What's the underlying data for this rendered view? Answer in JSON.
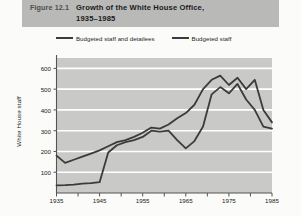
{
  "figure": {
    "number_label": "Figure 12.1",
    "title_lines": [
      "Growth of the White House Office,",
      "1935–1985"
    ],
    "banner_color": "#b9b9b7"
  },
  "legend": {
    "position": "top",
    "items": [
      {
        "label": "Budgeted staff and detailees",
        "color": "#3b3b3b"
      },
      {
        "label": "Budgeted staff",
        "color": "#3b3b3b"
      }
    ]
  },
  "chart_data": {
    "type": "line",
    "title": "Growth of the White House Office, 1935–1985",
    "xlabel": "",
    "ylabel": "White House staff",
    "xlim": [
      1935,
      1985
    ],
    "ylim": [
      0,
      650
    ],
    "grid": true,
    "grid_orientation": "horizontal",
    "plot_background": "#c9c9c7",
    "gridline_color": "#ffffff",
    "x_ticks_major": [
      1935,
      1945,
      1955,
      1965,
      1975,
      1985
    ],
    "x_ticks_minor": [
      1940,
      1950,
      1960,
      1970,
      1980
    ],
    "y_ticks": [
      100,
      200,
      300,
      400,
      500,
      600
    ],
    "series": [
      {
        "name": "Budgeted staff and detailees",
        "color": "#3b3b3b",
        "x": [
          1935,
          1937,
          1939,
          1941,
          1943,
          1945,
          1947,
          1949,
          1951,
          1953,
          1955,
          1957,
          1959,
          1961,
          1963,
          1965,
          1967,
          1969,
          1971,
          1973,
          1975,
          1977,
          1979,
          1981,
          1983,
          1985
        ],
        "y": [
          180,
          145,
          160,
          175,
          190,
          205,
          225,
          245,
          255,
          270,
          290,
          315,
          310,
          330,
          360,
          385,
          425,
          500,
          545,
          565,
          520,
          555,
          500,
          545,
          400,
          340
        ]
      },
      {
        "name": "Budgeted staff",
        "color": "#3b3b3b",
        "x": [
          1935,
          1937,
          1939,
          1941,
          1943,
          1945,
          1947,
          1949,
          1951,
          1953,
          1955,
          1957,
          1959,
          1961,
          1963,
          1965,
          1967,
          1969,
          1971,
          1973,
          1975,
          1977,
          1979,
          1981,
          1983,
          1985
        ],
        "y": [
          37,
          38,
          40,
          45,
          48,
          52,
          195,
          230,
          245,
          255,
          270,
          300,
          295,
          300,
          255,
          215,
          250,
          320,
          475,
          510,
          480,
          525,
          450,
          400,
          320,
          310
        ]
      }
    ]
  }
}
